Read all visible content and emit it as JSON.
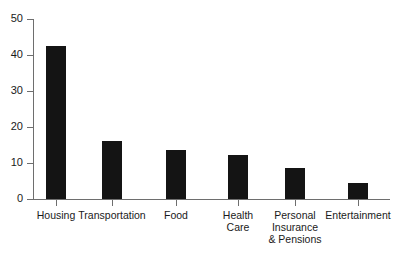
{
  "chart_data": {
    "type": "bar",
    "title": "",
    "subtitle": "",
    "xlabel": "",
    "ylabel": "",
    "ylim": [
      0,
      50
    ],
    "yticks": [
      0,
      10,
      20,
      30,
      40,
      50
    ],
    "ytick_labels": [
      "0",
      "10",
      "20",
      "30",
      "40",
      "50"
    ],
    "grid": false,
    "legend": null,
    "bar_color": "#141414",
    "axis_color": "#6e6e6e",
    "background_color": "#ffffff",
    "categories": [
      "Housing",
      "Transportation",
      "Food",
      "Health Care",
      "Personal Insurance & Pensions",
      "Entertainment"
    ],
    "category_label_lines": [
      [
        "Housing"
      ],
      [
        "Transportation"
      ],
      [
        "Food"
      ],
      [
        "Health",
        "Care"
      ],
      [
        "Personal",
        "Insurance",
        "& Pensions"
      ],
      [
        "Entertainment"
      ]
    ],
    "values": [
      42.5,
      16.0,
      13.5,
      12.2,
      8.5,
      4.5
    ]
  }
}
